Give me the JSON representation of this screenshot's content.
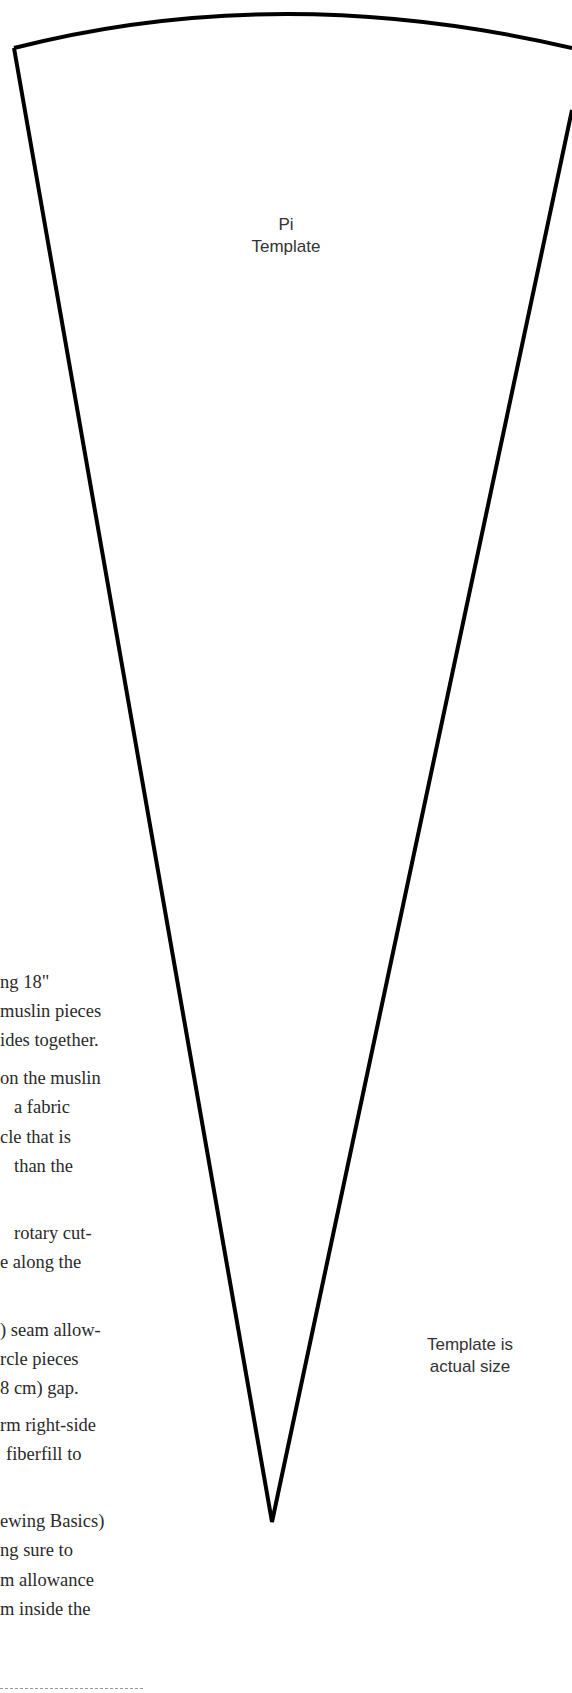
{
  "template": {
    "title_line1": "Pi",
    "title_line2": "Template",
    "note_line1": "Template is",
    "note_line2": "actual size",
    "outline_color": "#000000"
  },
  "instructions": {
    "lines": [
      {
        "text": "ng 18\"",
        "x": 0,
        "y": 970
      },
      {
        "text": "muslin pieces",
        "x": 0,
        "y": 999
      },
      {
        "text": "ides together.",
        "x": 0,
        "y": 1028
      },
      {
        "text": "on the muslin",
        "x": 0,
        "y": 1066
      },
      {
        "text": "a fabric",
        "x": 14,
        "y": 1095
      },
      {
        "text": "cle that is",
        "x": 0,
        "y": 1125
      },
      {
        "text": "than the",
        "x": 14,
        "y": 1154
      },
      {
        "text": "rotary cut-",
        "x": 14,
        "y": 1221
      },
      {
        "text": "e along the",
        "x": 0,
        "y": 1250
      },
      {
        "text": ") seam allow-",
        "x": 0,
        "y": 1318
      },
      {
        "text": "rcle pieces",
        "x": 0,
        "y": 1347
      },
      {
        "text": "8 cm) gap.",
        "x": 0,
        "y": 1376
      },
      {
        "text": "rm right-side",
        "x": 0,
        "y": 1413
      },
      {
        "text": "fiberfill to",
        "x": 6,
        "y": 1442
      },
      {
        "text": "ewing Basics)",
        "x": 0,
        "y": 1509
      },
      {
        "text": "ng sure to",
        "x": 0,
        "y": 1538
      },
      {
        "text": "m allowance",
        "x": 0,
        "y": 1568
      },
      {
        "text": "m inside the",
        "x": 0,
        "y": 1597
      }
    ]
  }
}
